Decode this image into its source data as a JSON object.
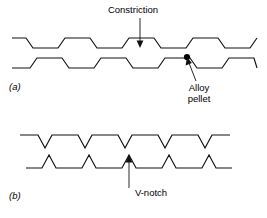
{
  "figure": {
    "title": "",
    "background_color": "#ffffff",
    "line_color": "#111111",
    "panels": [
      {
        "id": "a",
        "letter": "(a)",
        "letter_x": 9,
        "letter_y": 90,
        "description": "Upper and lower wires with trapezoidal constrictions; alloy pellet at one constriction",
        "wires": [
          {
            "name": "upper-wire-a",
            "points": "12,38 26,38 33,48 58,48 65,38 90,38 97,48 122,48 129,38 154,38 161,48 186,48 193,38 218,38 225,48 250,48 257,38"
          },
          {
            "name": "lower-wire-a",
            "points": "12,68 30,68 37,58 62,58 69,68 94,68 101,58 126,58 133,68 158,68 165,58 190,58 197,68 222,68 229,58 254,58 257,68"
          }
        ],
        "annotations": [
          {
            "name": "constriction",
            "text": "Constriction",
            "text_x": 133,
            "text_y": 13,
            "anchor": "middle",
            "leader": "140,18 140,42",
            "arrow": "140,48 136.6,40.5 143.4,40.5",
            "arrow_direction": "down"
          },
          {
            "name": "alloy-pellet",
            "text_lines": [
              "Alloy",
              "pellet"
            ],
            "text_x": 199,
            "text_y": 91,
            "line_height": 11,
            "anchor": "middle",
            "leader": "196,81 189,63",
            "arrow": "187,57 191.9,63.1 185.6,65.6",
            "arrow_direction": "up-left"
          }
        ],
        "pellet": {
          "name": "alloy-pellet-dot",
          "cx": 187,
          "cy": 57,
          "r": 3.1,
          "color": "#000000"
        }
      },
      {
        "id": "b",
        "letter": "(b)",
        "letter_x": 9,
        "letter_y": 199,
        "description": "Upper and lower wires with sharp V-notches",
        "wires": [
          {
            "name": "upper-wire-b",
            "points": "20,135 38,135 45,148 52,135 78,135 85,148 92,135 118,135 125,148 132,135 158,135 165,148 172,135 198,135 205,148 212,135 230,135"
          },
          {
            "name": "lower-wire-b",
            "points": "26,168 42,168 49,155 56,168 82,168 89,155 96,168 122,168 129,155 136,168 162,168 169,155 176,168 202,168 209,155 216,168 232,168"
          }
        ],
        "annotations": [
          {
            "name": "v-notch",
            "text": "V-notch",
            "text_x": 151,
            "text_y": 196,
            "anchor": "middle",
            "leader": "129,161 129,188",
            "arrow": "129,155 125.6,162.5 132.4,162.5",
            "arrow_direction": "up"
          }
        ]
      }
    ]
  }
}
